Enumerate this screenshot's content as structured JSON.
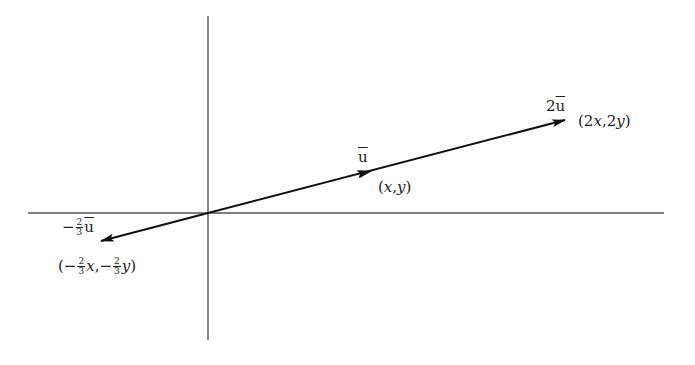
{
  "diagram": {
    "type": "vector-scalar-multiplication",
    "colors": {
      "axis": "#555555",
      "vector": "#111111",
      "text": "#222222",
      "background": "#ffffff"
    },
    "axes": {
      "horizontal": {
        "x1": 28,
        "y1": 213,
        "x2": 664,
        "y2": 213
      },
      "vertical": {
        "x1": 208,
        "y1": 16,
        "x2": 208,
        "y2": 340
      },
      "origin": {
        "x": 208,
        "y": 213
      }
    },
    "vectors": [
      {
        "id": "u",
        "label": "u",
        "label_overline": true,
        "point_label": "(x,y)",
        "tip": {
          "x": 372,
          "y": 171
        }
      },
      {
        "id": "2u",
        "label": "2u",
        "label_overline": true,
        "point_label": "(2x,2y)",
        "tip": {
          "x": 565,
          "y": 120
        }
      },
      {
        "id": "neg-two-thirds-u",
        "label": "−⅔u",
        "label_overline": true,
        "point_label": "(−⅔x,−⅔y)",
        "tip": {
          "x": 101,
          "y": 241
        }
      }
    ],
    "labels": {
      "u_vec": {
        "prefix": "",
        "letter": "u"
      },
      "two_u_vec": {
        "prefix": "2",
        "letter": "u"
      },
      "neg_two_thirds_vec": {
        "sign": "−",
        "num": "2",
        "den": "3",
        "letter": "u"
      },
      "xy": {
        "open": "(",
        "x": "x",
        "comma": ",",
        "y": "y",
        "close": ")"
      },
      "two_xy": {
        "open": "(",
        "c1": "2",
        "x": "x",
        "comma": ",",
        "c2": "2",
        "y": "y",
        "close": ")"
      },
      "neg_two_thirds_xy": {
        "open": "(",
        "sign1": "−",
        "num": "2",
        "den": "3",
        "x": "x",
        "comma": ",",
        "sign2": "−",
        "y": "y",
        "close": ")"
      }
    }
  }
}
